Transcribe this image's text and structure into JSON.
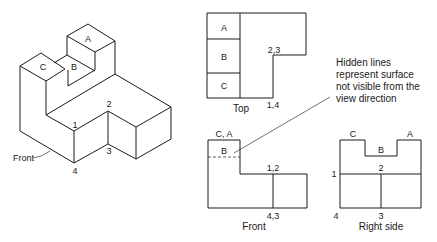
{
  "isometric": {
    "face_labels": {
      "a": "A",
      "b": "B",
      "c": "C"
    },
    "vertex_labels": {
      "v1": "1",
      "v2": "2",
      "v3": "3",
      "v4": "4"
    },
    "front_label": "Front"
  },
  "top_view": {
    "caption": "Top",
    "cells": [
      "A",
      "B",
      "C"
    ],
    "vertex_labels": {
      "upper": "2,3",
      "lower": "1,4"
    }
  },
  "front_view": {
    "caption": "Front",
    "labels": {
      "top_left": "C, A",
      "hidden": "B",
      "step": "1,2",
      "bottom": "4,3"
    }
  },
  "right_view": {
    "caption": "Right side",
    "labels": {
      "c": "C",
      "b": "B",
      "a": "A",
      "v1": "1",
      "v2": "2",
      "v3": "3",
      "v4": "4"
    }
  },
  "annotation": {
    "lines": [
      "Hidden lines",
      "represent surface",
      "not visible from the",
      "view direction"
    ]
  }
}
